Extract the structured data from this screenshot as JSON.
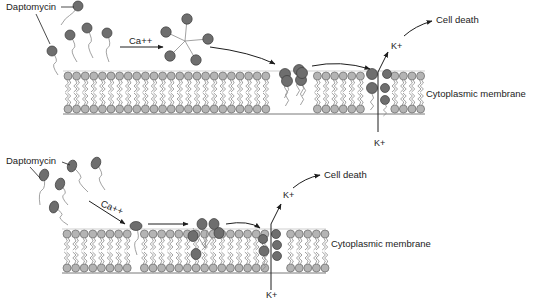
{
  "colors": {
    "background": "#ffffff",
    "lipid_head": "#b4b4b4",
    "lipid_head_stroke": "#6a6a6a",
    "drug_head": "#6e6e6e",
    "drug_head_stroke": "#3c3c3c",
    "tail": "#8a8a8a",
    "line": "#1e1e1e"
  },
  "panels": [
    {
      "id": "top",
      "drug_label": "Daptomycin",
      "calcium_label": "Ca++",
      "ion_label_out": "K+",
      "ion_label_in": "K+",
      "outcome_label": "Cell death",
      "membrane_label": "Cytoplasmic membrane"
    },
    {
      "id": "bottom",
      "drug_label": "Daptomycin",
      "calcium_label": "Ca++",
      "ion_label_out": "K+",
      "ion_label_in": "K+",
      "outcome_label": "Cell death",
      "membrane_label": "Cytoplasmic membrane"
    }
  ]
}
